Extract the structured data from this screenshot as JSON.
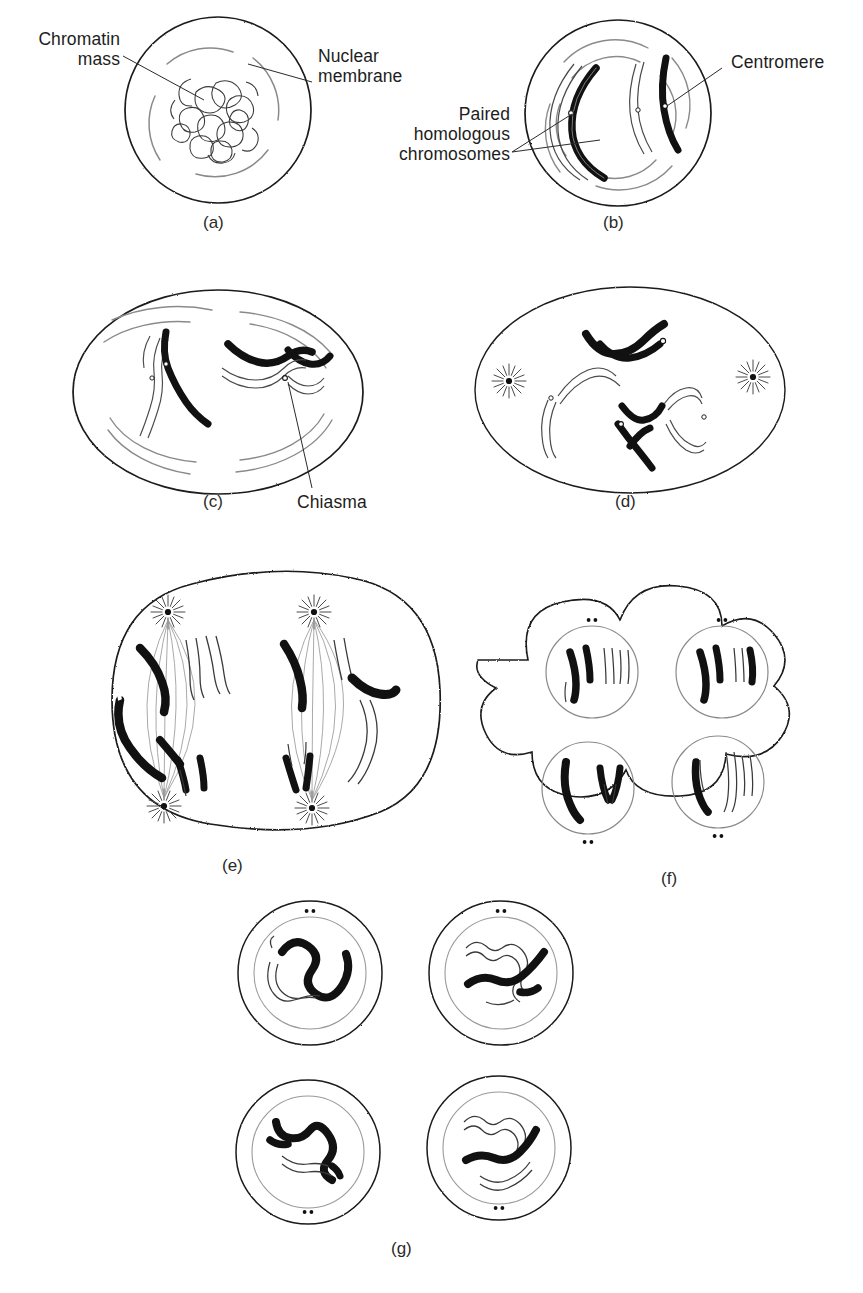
{
  "figure": {
    "background": "#ffffff",
    "ink": "#111111",
    "style": "line-art biological illustration"
  },
  "labels": {
    "chromatin_mass": "Chromatin\nmass",
    "nuclear_membrane": "Nuclear\nmembrane",
    "paired_homologous_chromosomes": "Paired\nhomologous\nchromosomes",
    "centromere": "Centromere",
    "chiasma": "Chiasma"
  },
  "panel_letters": {
    "a": "(a)",
    "b": "(b)",
    "c": "(c)",
    "d": "(d)",
    "e": "(e)",
    "f": "(f)",
    "g": "(g)"
  },
  "panels": [
    {
      "id": "a",
      "letter": "(a)",
      "shape": "circle",
      "stage": "interphase / early prophase I",
      "description": "Round cell with stippled outer membrane, inner nuclear membrane arcs, and a tangled chromatin mass at the centre",
      "labels": [
        "Chromatin mass",
        "Nuclear membrane"
      ],
      "chromosome_count_visible": 0,
      "nuclear_membrane_visible": true,
      "centrioles_visible": false
    },
    {
      "id": "b",
      "letter": "(b)",
      "shape": "circle",
      "stage": "prophase I — synapsis",
      "description": "Round cell containing two pairs of homologous chromosomes, one dark (paternal) and one outlined (maternal) per pair, each with a centromere constriction",
      "labels": [
        "Paired homologous chromosomes",
        "Centromere"
      ],
      "chromosome_count_visible": 4,
      "nuclear_membrane_visible": true,
      "centrioles_visible": false
    },
    {
      "id": "c",
      "letter": "(c)",
      "shape": "oval",
      "stage": "prophase I — crossing over",
      "description": "Oval cell with two bivalents; the right bivalent shows a chiasma where dark and light chromatids cross",
      "labels": [
        "Chiasma"
      ],
      "chromosome_count_visible": 4,
      "nuclear_membrane_visible": true,
      "centrioles_visible": false
    },
    {
      "id": "d",
      "letter": "(d)",
      "shape": "oval",
      "stage": "prometaphase I",
      "description": "Oval cell, nuclear membrane dissolved, two asters (centriole stars) at left and right poles, two bivalents in the centre",
      "labels": [],
      "chromosome_count_visible": 4,
      "nuclear_membrane_visible": false,
      "centrioles_visible": true
    },
    {
      "id": "e",
      "letter": "(e)",
      "shape": "rounded-square",
      "stage": "meiosis II — metaphase / anaphase",
      "description": "Large rounded cell containing two complete spindles, each with asters top and bottom and four chromosomes aligned between them",
      "labels": [],
      "chromosome_count_visible": 8,
      "nuclear_membrane_visible": false,
      "centrioles_visible": true
    },
    {
      "id": "f",
      "letter": "(f)",
      "shape": "cloverleaf",
      "stage": "telophase II",
      "description": "Four-lobed cell with four reforming nuclei, each containing two chromosomes, and a pair of centriole dots beside each nucleus",
      "labels": [],
      "chromosome_count_visible": 8,
      "nuclear_membrane_visible": true,
      "centrioles_visible": true
    },
    {
      "id": "g",
      "letter": "(g)",
      "shape": "four-circles",
      "stage": "four haploid daughter cells",
      "description": "Four separate round cells in a 2x2 arrangement, each with outer membrane, inner nuclear membrane and two decondensing chromosomes (one dark, one outlined), with centriole dots",
      "labels": [],
      "chromosome_count_visible": 8,
      "nuclear_membrane_visible": true,
      "centrioles_visible": true
    }
  ],
  "legend_key": {
    "dark_chromosome": "paternal chromosome (solid black)",
    "light_chromosome": "maternal chromosome (outline only)"
  }
}
